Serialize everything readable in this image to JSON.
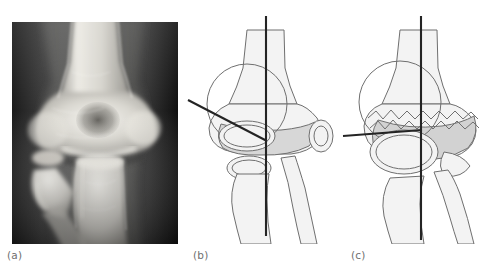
{
  "figure": {
    "kind": "medical-figure",
    "panel_count": 3
  },
  "panels": [
    {
      "id": "a",
      "caption": "(a)",
      "type": "radiograph",
      "subject": "elbow",
      "view": "anteroposterior",
      "background_color": "#2b2b2b",
      "bone_color": "#e8e8e4"
    },
    {
      "id": "b",
      "caption": "(b)",
      "type": "line-diagram",
      "subject": "normal elbow",
      "lines": [
        {
          "name": "vertical-axis-line",
          "orientation": "vertical"
        },
        {
          "name": "oblique-reference-line",
          "orientation": "oblique"
        }
      ],
      "physis_state": "normal"
    },
    {
      "id": "c",
      "caption": "(c)",
      "type": "line-diagram",
      "subject": "elbow with irregular physis / fracture line",
      "lines": [
        {
          "name": "vertical-axis-line",
          "orientation": "vertical"
        },
        {
          "name": "horizontal-reference-line",
          "orientation": "horizontal"
        }
      ],
      "physis_state": "irregular"
    }
  ],
  "colors": {
    "line_stroke": "#2a2a2a",
    "outline": "#6b6b6b",
    "bone_fill": "#f2f2f2",
    "cartilage_fill": "#d6d6d6",
    "caption_text": "#6f6f6f"
  }
}
